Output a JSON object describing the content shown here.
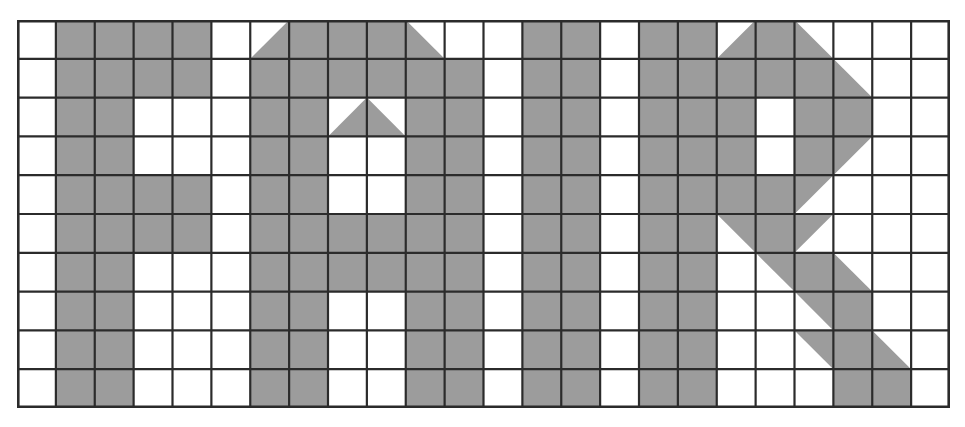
{
  "artwork": {
    "title": "FAIR",
    "description": "Grid pixel-art rendering of the word FAIR on a 24 by 10 cell lattice",
    "letters": [
      "F",
      "A",
      "I",
      "R"
    ]
  },
  "grid": {
    "columns": 24,
    "rows": 10,
    "origin_x": 17,
    "origin_y": 20,
    "cell_width": 38.875,
    "cell_height": 38.8,
    "line_color": "#2b2b2b",
    "line_width": 2.2,
    "outer_line_width": 2.6,
    "fill_color": "#9c9c9c",
    "background_color": "#ffffff"
  },
  "cells": {
    "legend": {
      "0": "empty",
      "1": "full",
      "tl": "triangle filling top-left half (diagonal from top-right to bottom-left)",
      "tr": "triangle filling top-right half (diagonal from top-left to bottom-right)",
      "bl": "triangle filling bottom-left half (diagonal from top-left to bottom-right)",
      "br": "triangle filling bottom-right half (diagonal from top-right to bottom-left)"
    },
    "rows": [
      [
        "0",
        "1",
        "1",
        "1",
        "1",
        "0",
        "br",
        "1",
        "1",
        "1",
        "bl",
        "0",
        "0",
        "1",
        "1",
        "0",
        "1",
        "1",
        "br",
        "1",
        "bl",
        "0",
        "0",
        "0"
      ],
      [
        "0",
        "1",
        "1",
        "1",
        "1",
        "0",
        "1",
        "1",
        "1",
        "1",
        "1",
        "1",
        "0",
        "1",
        "1",
        "0",
        "1",
        "1",
        "1",
        "1",
        "1",
        "bl",
        "0",
        "0"
      ],
      [
        "0",
        "1",
        "1",
        "0",
        "0",
        "0",
        "1",
        "1",
        "br",
        "bl",
        "1",
        "1",
        "0",
        "1",
        "1",
        "0",
        "1",
        "1",
        "1",
        "0",
        "1",
        "1",
        "0",
        "0"
      ],
      [
        "0",
        "1",
        "1",
        "0",
        "0",
        "0",
        "1",
        "1",
        "0",
        "0",
        "1",
        "1",
        "0",
        "1",
        "1",
        "0",
        "1",
        "1",
        "1",
        "0",
        "1",
        "tl",
        "0",
        "0"
      ],
      [
        "0",
        "1",
        "1",
        "1",
        "1",
        "0",
        "1",
        "1",
        "0",
        "0",
        "1",
        "1",
        "0",
        "1",
        "1",
        "0",
        "1",
        "1",
        "1",
        "1",
        "tl",
        "0",
        "0",
        "0"
      ],
      [
        "0",
        "1",
        "1",
        "1",
        "1",
        "0",
        "1",
        "1",
        "1",
        "1",
        "1",
        "1",
        "0",
        "1",
        "1",
        "0",
        "1",
        "1",
        "tr",
        "1",
        "tl",
        "0",
        "0",
        "0"
      ],
      [
        "0",
        "1",
        "1",
        "0",
        "0",
        "0",
        "1",
        "1",
        "1",
        "1",
        "1",
        "1",
        "0",
        "1",
        "1",
        "0",
        "1",
        "1",
        "0",
        "tr",
        "1",
        "bl",
        "0",
        "0"
      ],
      [
        "0",
        "1",
        "1",
        "0",
        "0",
        "0",
        "1",
        "1",
        "0",
        "0",
        "1",
        "1",
        "0",
        "1",
        "1",
        "0",
        "1",
        "1",
        "0",
        "0",
        "tr",
        "1",
        "0",
        "0"
      ],
      [
        "0",
        "1",
        "1",
        "0",
        "0",
        "0",
        "1",
        "1",
        "0",
        "0",
        "1",
        "1",
        "0",
        "1",
        "1",
        "0",
        "1",
        "1",
        "0",
        "0",
        "tr",
        "1",
        "bl",
        "0"
      ],
      [
        "0",
        "1",
        "1",
        "0",
        "0",
        "0",
        "1",
        "1",
        "0",
        "0",
        "1",
        "1",
        "0",
        "1",
        "1",
        "0",
        "1",
        "1",
        "0",
        "0",
        "0",
        "1",
        "1",
        "0"
      ]
    ]
  }
}
